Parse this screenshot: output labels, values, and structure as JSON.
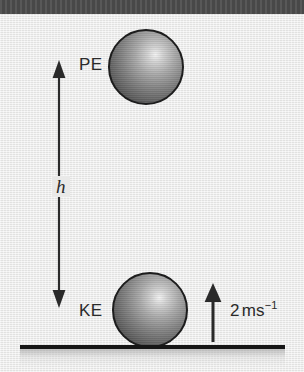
{
  "figure": {
    "width": 304,
    "height": 372,
    "background_color": "#e9e9e8",
    "top_bar_color": "#4e4e4e",
    "ink_color": "#2a2a2a"
  },
  "labels": {
    "potential_energy": "PE",
    "kinetic_energy": "KE",
    "height": "h",
    "speed_value": "2",
    "speed_unit": "ms",
    "speed_exponent": "−1"
  },
  "annotations": {
    "height_arrow": "double-headed vertical arrow spanning h",
    "velocity_arrow": "single-headed arrow pointing up",
    "ground": "ground line"
  },
  "objects": {
    "ball_top": "sphere at height h",
    "ball_bottom": "sphere at ground level"
  }
}
